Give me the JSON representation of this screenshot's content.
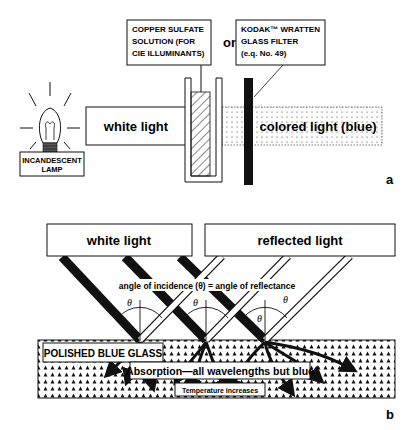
{
  "panel_a": {
    "lamp_label_line1": "INCANDESCENT",
    "lamp_label_line2": "LAMP",
    "white_light": "white light",
    "copper_label_line1": "COPPER SULFATE",
    "copper_label_line2": "SOLUTION (FOR",
    "copper_label_line3": "CIE ILLUMINANTS)",
    "or": "or",
    "kodak_label_line1": "KODAK™ WRATTEN",
    "kodak_label_line2": "GLASS FILTER",
    "kodak_label_line3": "(e.q. No. 49)",
    "colored_light": "colored light  (blue)",
    "panel_letter": "a"
  },
  "panel_b": {
    "white_light": "white light",
    "reflected_light": "reflected light",
    "angle_text": "angle of incidence (θ) = angle of reflectance",
    "theta": "θ",
    "glass_label": "POLISHED BLUE GLASS",
    "absorption_label": "Absorption—all wavelengths but blue",
    "temperature_label": "Temperature increases",
    "panel_letter": "b"
  },
  "colors": {
    "ink": "#111111",
    "paper": "#ffffff"
  }
}
